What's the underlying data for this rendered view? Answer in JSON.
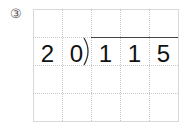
{
  "problem_number": "③",
  "divisor": [
    "2",
    "0"
  ],
  "dividend": [
    "1",
    "1",
    "5"
  ],
  "grid": {
    "columns": 5,
    "rows": 4
  }
}
